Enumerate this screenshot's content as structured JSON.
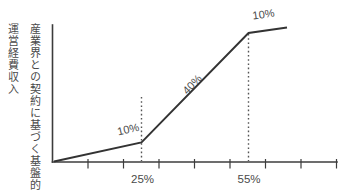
{
  "figure": {
    "title": "",
    "background": "#ffffff"
  },
  "colors": {
    "line": "#333333",
    "axis": "#3c3c3c",
    "guide": "#555555",
    "text": "#4a4a4a"
  },
  "axis": {
    "y_label_full": "産業界との契約に基づく基盤的運営経費収入",
    "y_label_line1": "産業界との契約に基づく基盤的",
    "y_label_line2": "運営経費収入",
    "x_tick_labels": [
      "25%",
      "55%"
    ]
  },
  "chart_data": {
    "type": "line",
    "title": "",
    "xlabel": "",
    "ylabel": "産業界との契約に基づく基盤的運営経費収入",
    "x_axis_unit": "percent",
    "x_tick_labels": [
      "25%",
      "55%"
    ],
    "dashed_guides_x": [
      "25%",
      "55%"
    ],
    "segment_slope_labels": [
      "10%",
      "40%",
      "10%"
    ],
    "points_percent": [
      {
        "x": 0,
        "y": 0
      },
      {
        "x": 25,
        "y": 2.5
      },
      {
        "x": 55,
        "y": 14.5
      },
      {
        "x": 66,
        "y": 15.6
      }
    ],
    "grid": false,
    "legend": "none"
  },
  "geometry": {
    "y_axis": {
      "x": 52.5,
      "y1": 25,
      "y2": 162
    },
    "x_axis": {
      "y": 162,
      "x1": 52.5,
      "x2": 337
    },
    "tick_y1": 159,
    "tick_y2": 168.5,
    "ticks_x": [
      88,
      123.5,
      159,
      194.5,
      230,
      265.5,
      301,
      336.5
    ],
    "dashed_guides": [
      {
        "x": 141.5,
        "y1": 97,
        "y2": 161
      },
      {
        "x": 248.5,
        "y1": 34,
        "y2": 161
      }
    ],
    "line_points_str": "54,161.5 141.5,142.5 248.5,33 287,27.5"
  },
  "labels": {
    "slope_labels": [
      {
        "text": "10%",
        "x": 129,
        "y": 133,
        "rot": -13
      },
      {
        "text": "40%",
        "x": 195,
        "y": 87,
        "rot": -46
      },
      {
        "text": "10%",
        "x": 264,
        "y": 18,
        "rot": -8
      }
    ],
    "x_tick_labels": [
      {
        "text": "25%",
        "x": 142.5,
        "y": 183
      },
      {
        "text": "55%",
        "x": 249,
        "y": 183
      }
    ]
  }
}
